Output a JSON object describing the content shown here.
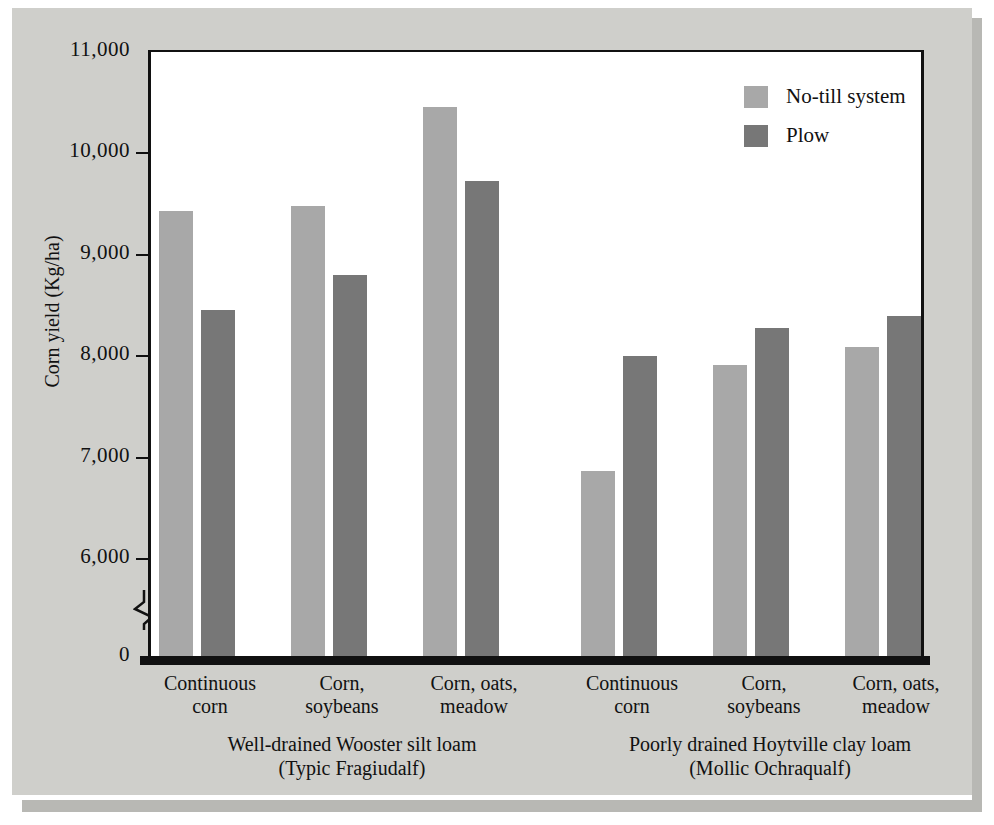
{
  "chart_data": {
    "type": "bar",
    "title": "",
    "xlabel": "",
    "ylabel": "Corn yield (Kg/ha)",
    "ylim": [
      0,
      11000
    ],
    "y_axis_break": true,
    "y_break_between": [
      0,
      6000
    ],
    "yticks": [
      "11,000",
      "10,000",
      "9,000",
      "8,000",
      "7,000",
      "6,000",
      "0"
    ],
    "ytick_values": [
      11000,
      10000,
      9000,
      8000,
      7000,
      6000,
      0
    ],
    "grid": false,
    "legend_position": "top-right",
    "categories": [
      "Continuous\ncorn",
      "Corn,\nsoybeans",
      "Corn, oats,\nmeadow",
      "Continuous\ncorn",
      "Corn,\nsoybeans",
      "Corn, oats,\nmeadow"
    ],
    "groups": [
      {
        "label_line1": "Well-drained Wooster silt loam",
        "label_line2": "(Typic Fragiudalf)",
        "categories": [
          "Continuous corn",
          "Corn, soybeans",
          "Corn, oats, meadow"
        ]
      },
      {
        "label_line1": "Poorly drained Hoytville clay loam",
        "label_line2": "(Mollic Ochraqualf)",
        "categories": [
          "Continuous corn",
          "Corn, soybeans",
          "Corn, oats, meadow"
        ]
      }
    ],
    "series": [
      {
        "name": "No-till system",
        "color": "#a8a8a8",
        "values": [
          9420,
          9470,
          10450,
          6860,
          7900,
          8080
        ]
      },
      {
        "name": "Plow",
        "color": "#777777",
        "values": [
          8450,
          8790,
          9720,
          7990,
          8270,
          8390
        ]
      }
    ]
  },
  "axis": {
    "ylabel": "Corn yield (Kg/ha)",
    "ticks": [
      {
        "label": "11,000",
        "value": 11000
      },
      {
        "label": "10,000",
        "value": 10000
      },
      {
        "label": "9,000",
        "value": 9000
      },
      {
        "label": "8,000",
        "value": 8000
      },
      {
        "label": "7,000",
        "value": 7000
      },
      {
        "label": "6,000",
        "value": 6000
      },
      {
        "label": "0",
        "value": 0
      }
    ]
  },
  "legend": {
    "items": [
      {
        "label": "No-till system",
        "color": "#a8a8a8"
      },
      {
        "label": "Plow",
        "color": "#777777"
      }
    ]
  },
  "categories": [
    {
      "line1": "Continuous",
      "line2": "corn"
    },
    {
      "line1": "Corn,",
      "line2": "soybeans"
    },
    {
      "line1": "Corn, oats,",
      "line2": "meadow"
    },
    {
      "line1": "Continuous",
      "line2": "corn"
    },
    {
      "line1": "Corn,",
      "line2": "soybeans"
    },
    {
      "line1": "Corn, oats,",
      "line2": "meadow"
    }
  ],
  "groups": [
    {
      "line1": "Well-drained Wooster silt loam",
      "line2": "(Typic Fragiudalf)"
    },
    {
      "line1": "Poorly drained Hoytville clay loam",
      "line2": "(Mollic Ochraqualf)"
    }
  ]
}
